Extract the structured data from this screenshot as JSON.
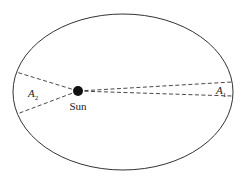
{
  "diagram": {
    "type": "kepler-second-law-orbit",
    "orbit": {
      "shape": "ellipse",
      "stroke": "#333333"
    },
    "sun": {
      "label": "Sun",
      "color": "#111111"
    },
    "regions": [
      {
        "id": "A1",
        "letter": "A",
        "subscript": "1",
        "side": "right"
      },
      {
        "id": "A2",
        "letter": "A",
        "subscript": "2",
        "side": "left"
      }
    ],
    "line_style": "dashed"
  }
}
